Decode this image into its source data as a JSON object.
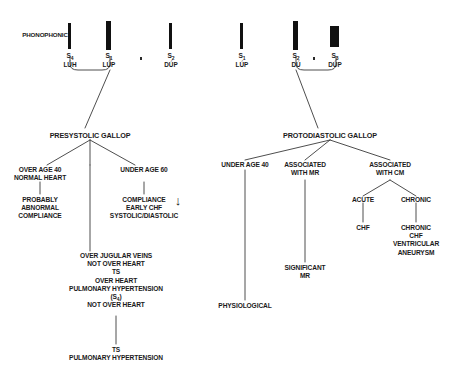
{
  "diagram": {
    "row_label": "PHONOPHONIC",
    "line_color": "#3a3a3a",
    "text_color": "#1a1a1a",
    "bar_color": "#111111",
    "background": "#ffffff"
  },
  "left_panel": {
    "sounds": [
      {
        "symbol": "S",
        "index": "4",
        "syllable": "LÚH"
      },
      {
        "symbol": "S",
        "index": "1",
        "syllable": "LÚP"
      },
      {
        "symbol": "S",
        "index": "2",
        "syllable": "DÚP"
      }
    ],
    "header": "PRESYSTOLIC GALLOP",
    "branch_left": {
      "condition": [
        "OVER AGE 40",
        "NORMAL HEART"
      ],
      "result": [
        "PROBABLY",
        "ABNORMAL",
        "COMPLIANCE"
      ]
    },
    "branch_right": {
      "condition": [
        "UNDER AGE 60"
      ],
      "result": [
        "COMPLIANCE",
        "EARLY CHF",
        "SYSTOLIC/DIASTOLIC"
      ],
      "arrow": "↓"
    },
    "branch_center": {
      "findings": [
        "OVER JUGULAR VEINS",
        "NOT OVER HEART",
        "TS",
        "OVER HEART",
        "PULMONARY HYPERTENSION",
        "(S4)",
        "NOT OVER HEART"
      ],
      "result": [
        "TS",
        "PULMONARY HYPERTENSION"
      ]
    }
  },
  "right_panel": {
    "sounds": [
      {
        "symbol": "S",
        "index": "1",
        "syllable": "LÚP"
      },
      {
        "symbol": "S",
        "index": "2",
        "syllable": "DÚ"
      },
      {
        "symbol": "S",
        "index": "3",
        "syllable": "DÚP"
      }
    ],
    "header": "PROTODIASTOLIC GALLOP",
    "branch_under_age": {
      "condition": [
        "UNDER AGE 40"
      ],
      "result": [
        "PHYSIOLOGICAL"
      ]
    },
    "branch_mr": {
      "condition": [
        "ASSOCIATED",
        "WITH MR"
      ],
      "result": [
        "SIGNIFICANT",
        "MR"
      ]
    },
    "branch_cm": {
      "condition": [
        "ASSOCIATED",
        "WITH CM"
      ],
      "sub_acute": {
        "label": "ACUTE",
        "result": [
          "CHF"
        ]
      },
      "sub_chronic": {
        "label": "CHRONIC",
        "result": [
          "CHRONIC",
          "CHF",
          "VENTRICULAR",
          "ANEURYSM"
        ]
      }
    }
  }
}
